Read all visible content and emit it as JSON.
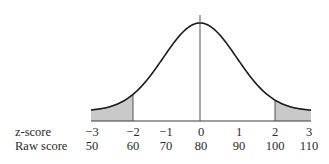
{
  "chart_data": {
    "type": "area",
    "title": "",
    "xlabel": "",
    "ylabel": "",
    "grid": false,
    "legend": null,
    "row_labels": [
      "z-score",
      "Raw score"
    ],
    "z_scores": [
      "−3",
      "−2",
      "−1",
      "0",
      "1",
      "2",
      "3"
    ],
    "raw_scores": [
      "50",
      "60",
      "70",
      "80",
      "90",
      "100",
      "110"
    ],
    "z_values": [
      -3,
      -2,
      -1,
      0,
      1,
      2,
      3
    ],
    "raw_values": [
      50,
      60,
      70,
      80,
      90,
      100,
      110
    ],
    "mean": 80,
    "sd": 10,
    "shaded_regions": [
      {
        "from_z": -3,
        "to_z": -2,
        "label": "lower tail"
      },
      {
        "from_z": 2,
        "to_z": 3,
        "label": "upper tail"
      }
    ],
    "center_line_z": 0,
    "xlim": [
      -3,
      3
    ],
    "colors": {
      "curve": "#1a1a1a",
      "shade": "#c9c9c9",
      "axis": "#3a3a3a"
    }
  }
}
